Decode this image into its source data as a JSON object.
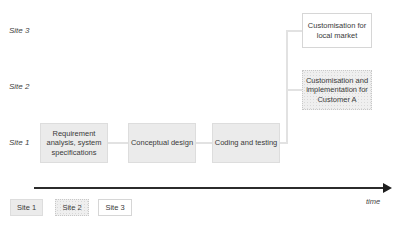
{
  "sites": {
    "site3": "Site 3",
    "site2": "Site 2",
    "site1": "Site 1"
  },
  "boxes": {
    "requirement": "Requirement analysis, system specifications",
    "conceptual": "Conceptual design",
    "coding": "Coding and testing",
    "customer_a": "Customisation and implementation for Customer A",
    "local_market": "Customisation for local market"
  },
  "axis": {
    "label": "time"
  },
  "legend": [
    {
      "label": "Site 1",
      "style": "solid-gray"
    },
    {
      "label": "Site 2",
      "style": "dotted-gray"
    },
    {
      "label": "Site 3",
      "style": "white"
    }
  ],
  "colors": {
    "site1_fill": "#ebebeb",
    "site2_fill": "#efefef",
    "site3_fill": "#ffffff",
    "axis": "#2b2b2b",
    "connector": "#e2e2e2"
  }
}
